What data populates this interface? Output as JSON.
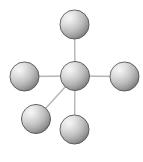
{
  "diagram": {
    "type": "node-link-diagram",
    "width": 143,
    "height": 162,
    "background_color": "#ffffff",
    "node_style": {
      "shape": "sphere",
      "radius": 14.5,
      "gradient_light_color": "#f2f2f2",
      "gradient_mid_color": "#b8b8b8",
      "gradient_dark_color": "#6e6e6e",
      "outline_color": "#5a5a5a",
      "outline_width": 1,
      "highlight_position": "upper-left"
    },
    "edge_style": {
      "color": "#b5b5b5",
      "width": 1.4
    },
    "nodes": [
      {
        "id": "hub",
        "label": "",
        "cx": 75,
        "cy": 76,
        "role": "center"
      },
      {
        "id": "top",
        "label": "",
        "cx": 74.5,
        "cy": 24.5,
        "role": "leaf"
      },
      {
        "id": "left",
        "label": "",
        "cx": 24.5,
        "cy": 76.5,
        "role": "leaf"
      },
      {
        "id": "right",
        "label": "",
        "cx": 124.5,
        "cy": 76.5,
        "role": "leaf"
      },
      {
        "id": "bottom",
        "label": "",
        "cx": 74.5,
        "cy": 129.5,
        "role": "leaf"
      },
      {
        "id": "bottom-left",
        "label": "",
        "cx": 36,
        "cy": 119,
        "role": "leaf"
      }
    ],
    "edges": [
      {
        "id": "edge-hub-top",
        "from": "hub",
        "to": "top"
      },
      {
        "id": "edge-hub-left",
        "from": "hub",
        "to": "left"
      },
      {
        "id": "edge-hub-right",
        "from": "hub",
        "to": "right"
      },
      {
        "id": "edge-hub-bottom",
        "from": "hub",
        "to": "bottom"
      },
      {
        "id": "edge-hub-bottom-left",
        "from": "hub",
        "to": "bottom-left"
      }
    ]
  }
}
